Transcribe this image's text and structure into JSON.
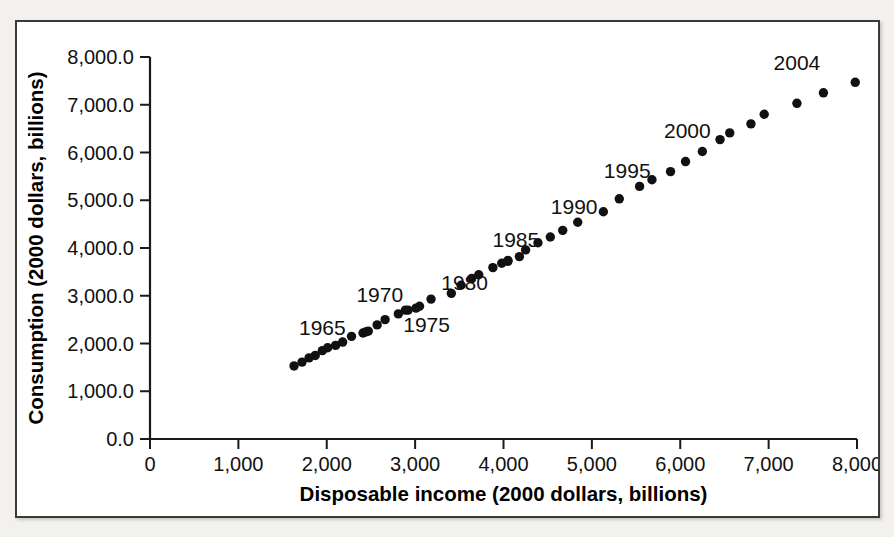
{
  "chart_data": {
    "type": "scatter",
    "title": "",
    "xlabel": "Disposable income (2000 dollars, billions)",
    "ylabel": "Consumption (2000 dollars, billions)",
    "xlim": [
      0,
      8000
    ],
    "ylim": [
      0,
      8000
    ],
    "grid": false,
    "legend": "none",
    "xticks": [
      0,
      1000,
      2000,
      3000,
      4000,
      5000,
      6000,
      7000,
      8000
    ],
    "xtick_labels": [
      "0",
      "1,000",
      "2,000",
      "3,000",
      "4,000",
      "5,000",
      "6,000",
      "7,000",
      "8,000"
    ],
    "yticks": [
      0,
      1000,
      2000,
      3000,
      4000,
      5000,
      6000,
      7000,
      8000
    ],
    "ytick_labels": [
      "0.0",
      "1,000.0",
      "2,000.0",
      "3,000.0",
      "4,000.0",
      "5,000.0",
      "6,000.0",
      "7,000.0",
      "8,000.0"
    ],
    "marker": "filled-circle",
    "marker_color": "#111111",
    "marker_size": 7,
    "points": [
      {
        "year": 1964,
        "x": 1630,
        "y": 1530
      },
      {
        "year": 1965,
        "x": 1720,
        "y": 1610
      },
      {
        "year": 1966,
        "x": 1800,
        "y": 1700
      },
      {
        "year": 1967,
        "x": 1870,
        "y": 1750
      },
      {
        "year": 1968,
        "x": 1950,
        "y": 1850
      },
      {
        "year": 1969,
        "x": 2010,
        "y": 1910
      },
      {
        "year": 1970,
        "x": 2100,
        "y": 1960
      },
      {
        "year": 1971,
        "x": 2180,
        "y": 2030
      },
      {
        "year": 1972,
        "x": 2280,
        "y": 2150
      },
      {
        "year": 1973,
        "x": 2440,
        "y": 2240
      },
      {
        "year": 1974,
        "x": 2410,
        "y": 2220
      },
      {
        "year": 1975,
        "x": 2470,
        "y": 2260
      },
      {
        "year": 1976,
        "x": 2570,
        "y": 2390
      },
      {
        "year": 1977,
        "x": 2660,
        "y": 2500
      },
      {
        "year": 1978,
        "x": 2810,
        "y": 2620
      },
      {
        "year": 1979,
        "x": 2890,
        "y": 2700
      },
      {
        "year": 1980,
        "x": 2920,
        "y": 2700
      },
      {
        "year": 1981,
        "x": 3010,
        "y": 2740
      },
      {
        "year": 1982,
        "x": 3050,
        "y": 2780
      },
      {
        "year": 1983,
        "x": 3180,
        "y": 2930
      },
      {
        "year": 1984,
        "x": 3410,
        "y": 3050
      },
      {
        "year": 1985,
        "x": 3520,
        "y": 3220
      },
      {
        "year": 1986,
        "x": 3640,
        "y": 3360
      },
      {
        "year": 1987,
        "x": 3720,
        "y": 3440
      },
      {
        "year": 1988,
        "x": 3880,
        "y": 3590
      },
      {
        "year": 1989,
        "x": 3980,
        "y": 3680
      },
      {
        "year": 1990,
        "x": 4050,
        "y": 3740
      },
      {
        "year": 1991,
        "x": 4050,
        "y": 3720
      },
      {
        "year": 1992,
        "x": 4180,
        "y": 3820
      },
      {
        "year": 1993,
        "x": 4250,
        "y": 3960
      },
      {
        "year": 1994,
        "x": 4390,
        "y": 4110
      },
      {
        "year": 1995,
        "x": 4530,
        "y": 4230
      },
      {
        "year": 1996,
        "x": 4670,
        "y": 4370
      },
      {
        "year": 1997,
        "x": 4840,
        "y": 4540
      },
      {
        "year": 1998,
        "x": 5130,
        "y": 4760
      },
      {
        "year": 1999,
        "x": 5310,
        "y": 5030
      },
      {
        "year": 2000,
        "x": 5540,
        "y": 5290
      },
      {
        "year": 2001,
        "x": 5680,
        "y": 5430
      },
      {
        "year": 2002,
        "x": 5890,
        "y": 5600
      },
      {
        "year": 2003,
        "x": 6060,
        "y": 5810
      },
      {
        "year": 2004,
        "x": 6250,
        "y": 6020
      },
      {
        "year": 2005,
        "x": 6450,
        "y": 6270
      },
      {
        "year": 2006,
        "x": 6560,
        "y": 6410
      },
      {
        "year": 2007,
        "x": 6800,
        "y": 6600
      },
      {
        "year": 2008,
        "x": 6950,
        "y": 6800
      },
      {
        "year": 2009,
        "x": 7320,
        "y": 7030
      },
      {
        "year": 2010,
        "x": 7620,
        "y": 7250
      },
      {
        "year": 2011,
        "x": 7980,
        "y": 7470
      }
    ],
    "annotations": [
      {
        "label": "1965",
        "x": 1950,
        "y": 2180
      },
      {
        "label": "1970",
        "x": 2600,
        "y": 2870
      },
      {
        "label": "1975",
        "x": 3130,
        "y": 2250
      },
      {
        "label": "1980",
        "x": 3560,
        "y": 3130
      },
      {
        "label": "1985",
        "x": 4140,
        "y": 4020
      },
      {
        "label": "1990",
        "x": 4800,
        "y": 4720
      },
      {
        "label": "1995",
        "x": 5400,
        "y": 5460
      },
      {
        "label": "2000",
        "x": 6080,
        "y": 6300
      },
      {
        "label": "2004",
        "x": 7320,
        "y": 7720
      }
    ]
  }
}
